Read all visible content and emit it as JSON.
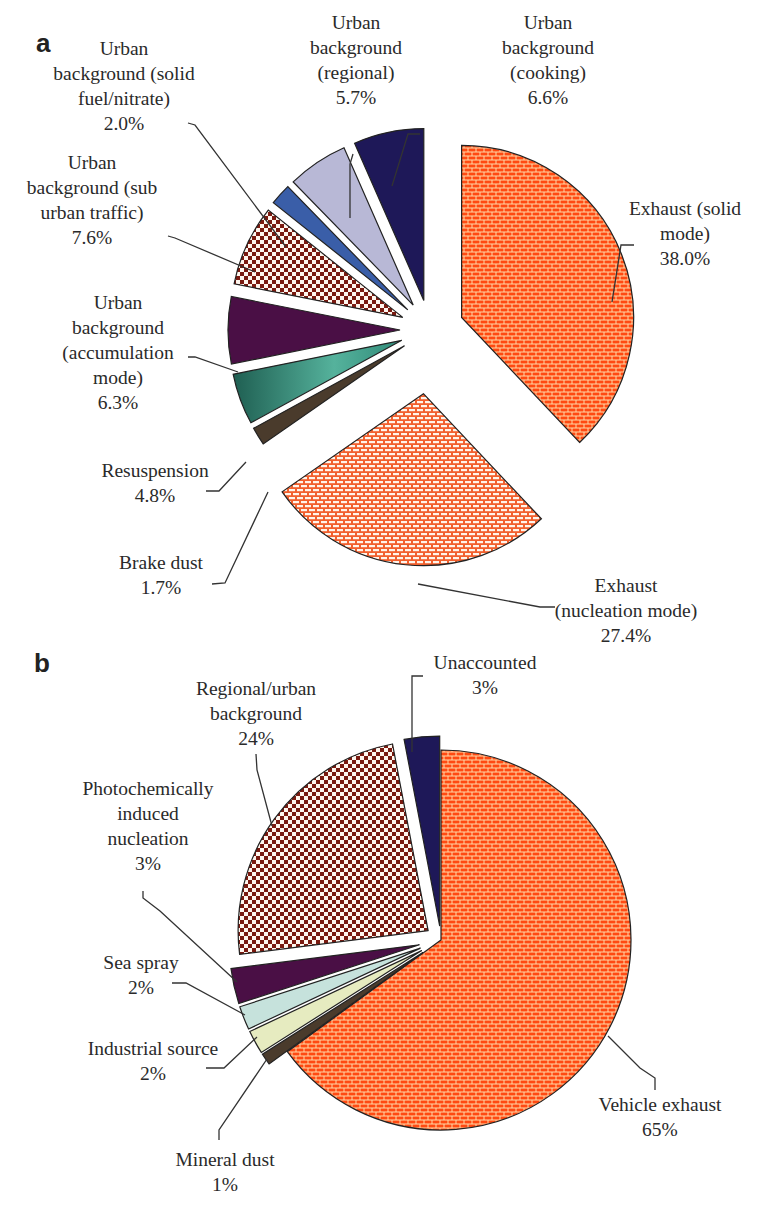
{
  "chart_data": [
    {
      "panel": "a",
      "type": "pie",
      "title": "",
      "start": "12 o'clock, clockwise",
      "center": [
        430,
        330
      ],
      "radius": 172,
      "slices": [
        {
          "label": "Exhaust (solid mode)",
          "value": 38.0,
          "display": "38.0%",
          "fill": "#ff5a1e",
          "pattern": "brick-dense",
          "explode": 34
        },
        {
          "label": "Exhaust (nucleation mode)",
          "value": 27.4,
          "display": "27.4%",
          "fill": "#ff6a3a",
          "pattern": "brick-light",
          "explode": 64
        },
        {
          "label": "Brake dust",
          "value": 1.7,
          "display": "1.7%",
          "fill": "#4a3b2c",
          "pattern": "solid",
          "explode": 30
        },
        {
          "label": "Resuspension",
          "value": 4.8,
          "display": "4.8%",
          "fill": "#3d9a86",
          "pattern": "solid",
          "explode": 30
        },
        {
          "label": "Urban background (accumulation mode)",
          "value": 6.3,
          "display": "6.3%",
          "fill": "#4a0f45",
          "pattern": "solid",
          "explode": 30
        },
        {
          "label": "Urban background (sub urban traffic)",
          "value": 7.6,
          "display": "7.6%",
          "fill": "#7a1a10",
          "pattern": "checker",
          "explode": 30
        },
        {
          "label": "Urban background (solid fuel/nitrate)",
          "value": 2.0,
          "display": "2.0%",
          "fill": "#3a5ea8",
          "pattern": "solid",
          "explode": 30
        },
        {
          "label": "Urban background (regional)",
          "value": 5.7,
          "display": "5.7%",
          "fill": "#b8b8d6",
          "pattern": "solid",
          "explode": 30
        },
        {
          "label": "Urban background (cooking)",
          "value": 6.6,
          "display": "6.6%",
          "fill": "#1e1858",
          "pattern": "solid",
          "explode": 30
        }
      ]
    },
    {
      "panel": "b",
      "type": "pie",
      "title": "",
      "start": "12 o'clock, clockwise",
      "center": [
        441,
        940
      ],
      "radius": 190,
      "slices": [
        {
          "label": "Vehicle exhaust",
          "value": 65,
          "display": "65%",
          "fill": "#ff5a1e",
          "pattern": "brick-dense",
          "explode": 0
        },
        {
          "label": "Mineral dust",
          "value": 1,
          "display": "1%",
          "fill": "#4a3b2c",
          "pattern": "solid",
          "explode": 22
        },
        {
          "label": "Industrial source",
          "value": 2,
          "display": "2%",
          "fill": "#e6ebc0",
          "pattern": "solid",
          "explode": 22
        },
        {
          "label": "Sea spray",
          "value": 2,
          "display": "2%",
          "fill": "#c6e2dc",
          "pattern": "solid",
          "explode": 22
        },
        {
          "label": "Photochemically induced nucleation",
          "value": 3,
          "display": "3%",
          "fill": "#4a0f45",
          "pattern": "solid",
          "explode": 22
        },
        {
          "label": "Regional/urban background",
          "value": 24,
          "display": "24%",
          "fill": "#7a1a10",
          "pattern": "checker",
          "explode": 16
        },
        {
          "label": "Unaccounted",
          "value": 3,
          "display": "3%",
          "fill": "#1e1858",
          "pattern": "solid",
          "explode": 14
        }
      ]
    }
  ],
  "panels": {
    "a": {
      "letter": "a"
    },
    "b": {
      "letter": "b"
    }
  },
  "labels": {
    "a": {
      "cooking": [
        "Urban",
        "background",
        "(cooking)",
        "6.6%"
      ],
      "regional": [
        "Urban",
        "background",
        "(regional)",
        "5.7%"
      ],
      "solid_fuel": [
        "Urban",
        "background (solid",
        "fuel/nitrate)",
        "2.0%"
      ],
      "sub_urban": [
        "Urban",
        "background (sub",
        "urban traffic)",
        "7.6%"
      ],
      "accumulation": [
        "Urban",
        "background",
        "(accumulation",
        "mode)",
        "6.3%"
      ],
      "resuspension": [
        "Resuspension",
        "4.8%"
      ],
      "brake": [
        "Brake dust",
        "1.7%"
      ],
      "solid_mode": [
        "Exhaust (solid",
        "mode)",
        "38.0%"
      ],
      "nucleation": [
        "Exhaust",
        "(nucleation mode)",
        "27.4%"
      ]
    },
    "b": {
      "unaccounted": [
        "Unaccounted",
        "3%"
      ],
      "regional_urban": [
        "Regional/urban",
        "background",
        "24%"
      ],
      "photochem": [
        "Photochemically",
        "induced",
        "nucleation",
        "3%"
      ],
      "sea_spray": [
        "Sea spray",
        "2%"
      ],
      "industrial": [
        "Industrial source",
        "2%"
      ],
      "mineral": [
        "Mineral dust",
        "1%"
      ],
      "vehicle": [
        "Vehicle exhaust",
        "65%"
      ]
    }
  }
}
